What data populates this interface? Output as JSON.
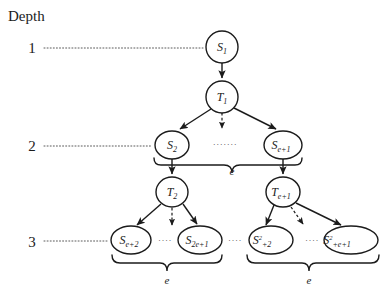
{
  "diagram": {
    "title": "Depth",
    "depth_labels": [
      {
        "id": "depth-1",
        "text": "1"
      },
      {
        "id": "depth-2",
        "text": "2"
      },
      {
        "id": "depth-3",
        "text": "3"
      }
    ],
    "nodes": [
      {
        "id": "node-s1",
        "base": "S",
        "sub": "1",
        "sup": "",
        "kind": "S",
        "level": 1,
        "cx": 222,
        "cy": 47,
        "rx": 16,
        "ry": 16
      },
      {
        "id": "node-t1",
        "base": "T",
        "sub": "1",
        "sup": "",
        "kind": "T",
        "level": 1,
        "cx": 222,
        "cy": 97,
        "rx": 16,
        "ry": 16
      },
      {
        "id": "node-s2",
        "base": "S",
        "sub": "2",
        "sup": "",
        "kind": "S",
        "level": 2,
        "cx": 172,
        "cy": 145,
        "rx": 17,
        "ry": 14
      },
      {
        "id": "node-se1",
        "base": "S",
        "sub": "e+1",
        "sup": "",
        "kind": "S",
        "level": 2,
        "cx": 283,
        "cy": 145,
        "rx": 19,
        "ry": 14
      },
      {
        "id": "node-t2",
        "base": "T",
        "sub": "2",
        "sup": "",
        "kind": "T",
        "level": 2,
        "cx": 172,
        "cy": 192,
        "rx": 16,
        "ry": 15
      },
      {
        "id": "node-te1",
        "base": "T",
        "sub": "e+1",
        "sup": "",
        "kind": "T",
        "level": 2,
        "cx": 283,
        "cy": 192,
        "rx": 17,
        "ry": 15
      },
      {
        "id": "node-se2",
        "base": "S",
        "sub": "e+2",
        "sup": "",
        "kind": "S",
        "level": 3,
        "cx": 131,
        "cy": 240,
        "rx": 20,
        "ry": 14
      },
      {
        "id": "node-s2e1",
        "base": "S",
        "sub": "2e+1",
        "sup": "",
        "kind": "S",
        "level": 3,
        "cx": 200,
        "cy": 240,
        "rx": 22,
        "ry": 14
      },
      {
        "id": "node-se22",
        "base": "S",
        "sub": "+2",
        "sup": "2",
        "kind": "S",
        "level": 3,
        "cx": 271,
        "cy": 240,
        "rx": 22,
        "ry": 14
      },
      {
        "id": "node-se2e1",
        "base": "S",
        "sub": "+e+1",
        "sup": "2",
        "kind": "S",
        "level": 3,
        "cx": 351,
        "cy": 240,
        "rx": 27,
        "ry": 14
      }
    ],
    "brace_labels": [
      {
        "id": "brace-level2",
        "text": "e",
        "x": 232,
        "y": 175
      },
      {
        "id": "brace-level3-left",
        "text": "e",
        "x": 167,
        "y": 284
      },
      {
        "id": "brace-level3-right",
        "text": "e",
        "x": 309,
        "y": 284
      }
    ],
    "ellipses": [
      {
        "id": "ellipsis-level2",
        "text": "·······",
        "x": 225,
        "y": 147
      },
      {
        "id": "ellipsis-level3-a",
        "text": "····",
        "x": 165,
        "y": 243
      },
      {
        "id": "ellipsis-level3-b",
        "text": "····",
        "x": 235,
        "y": 243
      },
      {
        "id": "ellipsis-level3-c",
        "text": "····",
        "x": 312,
        "y": 243
      }
    ],
    "colors": {
      "stroke": "#1b1b1b",
      "background": "#ffffff",
      "leader": "#5a5a5a"
    }
  }
}
